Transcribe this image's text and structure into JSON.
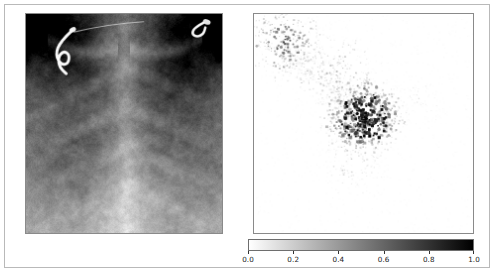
{
  "figure": {
    "background_color": "#ffffff",
    "frame_color": "#b9b9b9",
    "width": 499,
    "height": 280
  },
  "panels": [
    {
      "name": "chest-xray",
      "kind": "image",
      "title": "",
      "axis_visible": false,
      "tick_labels_visible": false,
      "colormap": "gray",
      "description": "Frontal pediatric chest radiograph showing rib cage, both lungs, cardiac silhouette and diaphragm, with a curled radiopaque lead/wire over the upper-left field."
    },
    {
      "name": "saliency-map",
      "kind": "image",
      "title": "",
      "axis_visible": false,
      "tick_labels_visible": false,
      "colormap": "gray_r",
      "description": "Sparse saliency/attribution heatmap on white background; a dense cluster of dark high-attribution points near the centre, a looser scatter toward the upper-left corner, and faint sparse points below centre."
    }
  ],
  "colorbar": {
    "name": "saliency-colorbar",
    "orientation": "horizontal",
    "colormap": "gray_r",
    "low_color": "#ffffff",
    "high_color": "#000000",
    "vmin": 0.0,
    "vmax": 1.0,
    "tick_values": [
      0.0,
      0.2,
      0.4,
      0.6,
      0.8,
      1.0
    ],
    "tick_labels": [
      "0.0",
      "0.2",
      "0.4",
      "0.6",
      "0.8",
      "1.0"
    ],
    "label": ""
  },
  "chart_data": {
    "type": "heatmap",
    "title": "",
    "xlabel": "",
    "ylabel": "",
    "grid": false,
    "legend_position": "bottom",
    "colormap": "gray_r",
    "colorbar_range": [
      0.0,
      1.0
    ],
    "colorbar_ticks": [
      0.0,
      0.2,
      0.4,
      0.6,
      0.8,
      1.0
    ],
    "panel_count": 2,
    "panels": [
      {
        "index": 0,
        "name": "chest-xray",
        "type": "image",
        "colormap": "gray",
        "value_range": [
          0.0,
          1.0
        ],
        "grid_shape": [
          221,
          198
        ],
        "content": "chest radiograph"
      },
      {
        "index": 1,
        "name": "saliency-map",
        "type": "heatmap",
        "colormap": "gray_r",
        "value_range": [
          0.0,
          1.0
        ],
        "grid_shape": [
          221,
          221
        ],
        "content": "sparse pixel attribution map",
        "hotspots": [
          {
            "label": "central cluster",
            "x_frac": 0.5,
            "y_frac": 0.47,
            "radius_frac": 0.15,
            "peak_value": 1.0,
            "density": "high"
          },
          {
            "label": "upper-left scatter",
            "x_frac": 0.14,
            "y_frac": 0.13,
            "radius_frac": 0.14,
            "peak_value": 0.75,
            "density": "medium"
          },
          {
            "label": "upper-mid sparse",
            "x_frac": 0.38,
            "y_frac": 0.26,
            "radius_frac": 0.16,
            "peak_value": 0.45,
            "density": "low"
          },
          {
            "label": "below-centre sparse",
            "x_frac": 0.45,
            "y_frac": 0.68,
            "radius_frac": 0.13,
            "peak_value": 0.35,
            "density": "low"
          },
          {
            "label": "right faint",
            "x_frac": 0.74,
            "y_frac": 0.4,
            "radius_frac": 0.12,
            "peak_value": 0.25,
            "density": "very-low"
          }
        ]
      }
    ]
  }
}
